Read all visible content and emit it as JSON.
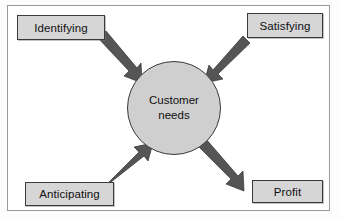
{
  "diagram": {
    "frame": {
      "stroke": "#9a9a9a",
      "fill": "#ffffff"
    },
    "palette": {
      "box_fill": "#d6d6d6",
      "box_stroke": "#3a3a3a",
      "circle_fill": "#cfcfcf",
      "circle_stroke": "#3a3a3a",
      "arrow_fill": "#555555",
      "text": "#101010",
      "background": "#ffffff"
    },
    "nodes": {
      "identifying": {
        "label": "Identifying",
        "position": "top-left"
      },
      "satisfying": {
        "label": "Satisfying",
        "position": "top-right"
      },
      "anticipating": {
        "label": "Anticipating",
        "position": "bottom-left"
      },
      "profit": {
        "label": "Profit",
        "position": "bottom-right"
      },
      "center": {
        "label_line1": "Customer",
        "label_line2": "needs",
        "shape": "circle",
        "position": "center"
      }
    },
    "arrows": [
      {
        "name": "identifying-to-center",
        "from": "Identifying",
        "to": "Customer needs",
        "direction": "down-right"
      },
      {
        "name": "satisfying-to-center",
        "from": "Satisfying",
        "to": "Customer needs",
        "direction": "down-left"
      },
      {
        "name": "anticipating-to-center",
        "from": "Anticipating",
        "to": "Customer needs",
        "direction": "up-right"
      },
      {
        "name": "center-to-profit",
        "from": "Customer needs",
        "to": "Profit",
        "direction": "down-right"
      }
    ]
  }
}
